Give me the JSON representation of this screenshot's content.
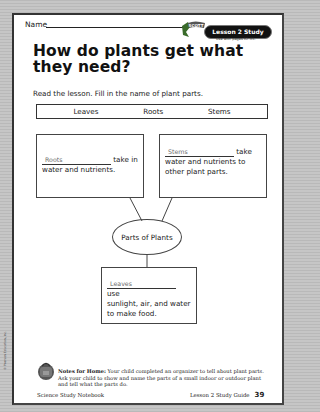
{
  "header": {
    "name_label": "Name",
    "badge": "Lesson 2 Study Guide",
    "badge_sub": "Use with pages 82–85."
  },
  "title": "How do plants get what they need?",
  "instructions": "Read the lesson. Fill in the name of plant parts.",
  "word_bank": [
    "Leaves",
    "Roots",
    "Stems"
  ],
  "organizer": {
    "center": "Parts of Plants",
    "boxes": [
      {
        "answer": "Roots",
        "text_after": "take in",
        "text_rest": "water and nutrients."
      },
      {
        "answer": "Stems",
        "text_after": "take",
        "text_rest": "water and nutrients to other plant parts."
      },
      {
        "answer": "Leaves",
        "text_after": "use",
        "text_rest": "sunlight, air, and water to make food."
      }
    ]
  },
  "copyright": "© Pearson Education, Inc.",
  "notes": {
    "label": "Notes for Home:",
    "text": "Your child completed an organizer to tell about plant parts. Ask your child to show and name the parts of a small indoor or outdoor plant and tell what the parts do."
  },
  "footer": {
    "left": "Science Study Notebook",
    "right": "Lesson 2 Study Guide",
    "page_number": "39"
  }
}
